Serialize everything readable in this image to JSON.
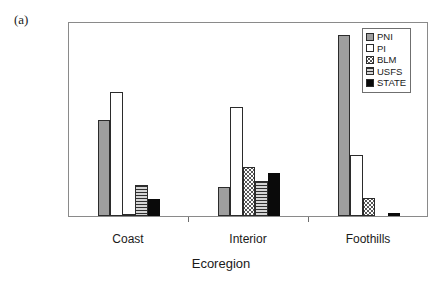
{
  "panel": {
    "label": "(a)"
  },
  "chart_data": {
    "type": "bar",
    "title": "",
    "xlabel": "Ecoregion",
    "ylabel": "Percent of Ecoregion",
    "categories": [
      "Coast",
      "Interior",
      "Foothills"
    ],
    "ylim": [
      0,
      70
    ],
    "yticks": [
      0,
      10,
      20,
      30,
      40,
      50,
      60,
      70
    ],
    "ytick_labels": [
      "0",
      "10",
      "20",
      "30",
      "40",
      "50",
      "60",
      "70"
    ],
    "grid": false,
    "legend_position": "top-right",
    "series": [
      {
        "name": "PNI",
        "fill": "solid-gray",
        "values": [
          34.5,
          10.5,
          65.0
        ]
      },
      {
        "name": "PI",
        "fill": "white",
        "values": [
          44.5,
          39.0,
          22.0
        ]
      },
      {
        "name": "BLM",
        "fill": "dots",
        "values": [
          0.5,
          17.5,
          6.5
        ]
      },
      {
        "name": "USFS",
        "fill": "hatch",
        "values": [
          11.0,
          12.5,
          0.0
        ]
      },
      {
        "name": "STATE",
        "fill": "black",
        "values": [
          6.0,
          15.5,
          1.0
        ]
      }
    ]
  }
}
